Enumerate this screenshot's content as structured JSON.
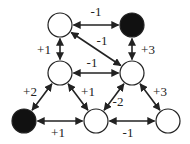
{
  "diagram": {
    "type": "signed-graph",
    "node_radius": 12,
    "colors": {
      "filled": "#111111",
      "empty": "#ffffff",
      "stroke": "#222222",
      "edge": "#222222"
    },
    "nodes": [
      {
        "id": "n_top_left",
        "x": 60,
        "y": 25,
        "filled": false
      },
      {
        "id": "n_top_right",
        "x": 132,
        "y": 25,
        "filled": true
      },
      {
        "id": "n_mid_left",
        "x": 60,
        "y": 73,
        "filled": false
      },
      {
        "id": "n_mid_right",
        "x": 132,
        "y": 73,
        "filled": false
      },
      {
        "id": "n_bot_left",
        "x": 24,
        "y": 121,
        "filled": true
      },
      {
        "id": "n_bot_mid",
        "x": 96,
        "y": 121,
        "filled": false
      },
      {
        "id": "n_bot_right",
        "x": 168,
        "y": 121,
        "filled": false
      }
    ],
    "edges": [
      {
        "from": "n_top_left",
        "to": "n_top_right",
        "weight": "-1",
        "lx": 96,
        "ly": 16
      },
      {
        "from": "n_top_left",
        "to": "n_mid_right",
        "weight": "-1",
        "lx": 102,
        "ly": 45
      },
      {
        "from": "n_top_left",
        "to": "n_mid_left",
        "weight": "+1",
        "lx": 44,
        "ly": 54
      },
      {
        "from": "n_top_right",
        "to": "n_mid_right",
        "weight": "+3",
        "lx": 148,
        "ly": 54
      },
      {
        "from": "n_mid_left",
        "to": "n_mid_right",
        "weight": "-1",
        "lx": 92,
        "ly": 67
      },
      {
        "from": "n_mid_left",
        "to": "n_bot_left",
        "weight": "+2",
        "lx": 30,
        "ly": 96
      },
      {
        "from": "n_mid_left",
        "to": "n_bot_mid",
        "weight": "+1",
        "lx": 88,
        "ly": 96
      },
      {
        "from": "n_mid_right",
        "to": "n_bot_mid",
        "weight": "-2",
        "lx": 118,
        "ly": 106
      },
      {
        "from": "n_mid_right",
        "to": "n_bot_right",
        "weight": "+3",
        "lx": 160,
        "ly": 96
      },
      {
        "from": "n_bot_left",
        "to": "n_bot_mid",
        "weight": "+1",
        "lx": 58,
        "ly": 137
      },
      {
        "from": "n_bot_mid",
        "to": "n_bot_right",
        "weight": "-1",
        "lx": 128,
        "ly": 137
      }
    ]
  }
}
